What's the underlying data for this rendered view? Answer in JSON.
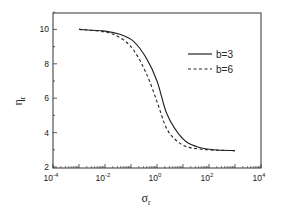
{
  "chart_data": {
    "type": "line",
    "title": "",
    "xlabel": "σ_r",
    "ylabel": "η_r",
    "xscale": "log",
    "xlim": [
      0.0001,
      10000
    ],
    "ylim": [
      2,
      11
    ],
    "grid": false,
    "legend_position": "upper right",
    "x_ticks": [
      "10^-4",
      "10^-2",
      "10^0",
      "10^2",
      "10^4"
    ],
    "y_ticks": [
      "2",
      "4",
      "6",
      "8",
      "10"
    ],
    "series": [
      {
        "name": "b=3",
        "style": "solid",
        "log10_x": [
          -3,
          -2,
          -1.4,
          -0.9,
          -0.4,
          0,
          0.35,
          0.7,
          1.1,
          1.6,
          2.2,
          3
        ],
        "values": [
          10,
          9.9,
          9.7,
          9.3,
          8.3,
          7.0,
          5.2,
          4.2,
          3.5,
          3.15,
          3.0,
          2.95
        ]
      },
      {
        "name": "b=6",
        "style": "dashed",
        "log10_x": [
          -3,
          -2,
          -1.4,
          -0.9,
          -0.4,
          0,
          0.35,
          0.7,
          1.1,
          1.6,
          2.2,
          3
        ],
        "values": [
          10,
          9.85,
          9.5,
          8.8,
          7.4,
          5.8,
          4.3,
          3.6,
          3.2,
          3.05,
          2.98,
          2.95
        ]
      }
    ]
  },
  "axes": {
    "x_tick_base": "10",
    "x_tick_exponents": [
      "-4",
      "-2",
      "0",
      "2",
      "4"
    ],
    "y_tick_labels": [
      "2",
      "4",
      "6",
      "8",
      "10"
    ],
    "xlabel_main": "σ",
    "xlabel_sub": "r",
    "ylabel_main": "η",
    "ylabel_sub": "r"
  },
  "legend": {
    "items": [
      {
        "label": "b=3",
        "style": "solid"
      },
      {
        "label": "b=6",
        "style": "dashed"
      }
    ]
  }
}
